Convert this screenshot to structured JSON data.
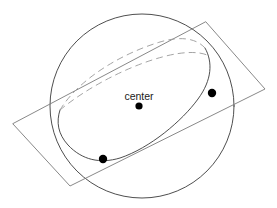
{
  "figure": {
    "background_color": "#ffffff",
    "width": 277,
    "height": 208,
    "stroke_color": "#3a3a3a",
    "dashed_stroke_color": "#8c8c8c",
    "point_color": "#000000",
    "label_color": "#1a1a1a"
  },
  "labels": {
    "center": "center"
  },
  "chart_data": {
    "type": "scatter",
    "title": "",
    "xlabel": "",
    "ylabel": "",
    "xlim": [
      0,
      277
    ],
    "ylim": [
      0,
      208
    ],
    "grid": false,
    "legend": "none",
    "shapes": [
      {
        "name": "sphere-outline-circle",
        "kind": "circle",
        "cx": 142,
        "cy": 106,
        "r": 92,
        "style": "solid",
        "stroke": "#3a3a3a",
        "stroke_width": 0.9,
        "fill": "none"
      },
      {
        "name": "tangent-plane-parallelogram",
        "kind": "polygon",
        "points": [
          [
            206,
            22
          ],
          [
            265,
            89
          ],
          [
            70,
            186
          ],
          [
            13,
            124
          ]
        ],
        "style": "solid",
        "stroke": "#7a7a7a",
        "stroke_width": 0.9,
        "fill": "none"
      },
      {
        "name": "great-circle-front-solid-arc",
        "kind": "path",
        "d": "M 205 48 C 213 62 212 80 198 99 C 182 121 150 148 120 158 C 100 164 82 160 68 145 C 58 134 56 122 60 110",
        "style": "solid",
        "stroke": "#3a3a3a",
        "stroke_width": 0.9,
        "fill": "none"
      },
      {
        "name": "great-circle-back-dashed-arc-upper",
        "kind": "path",
        "d": "M 60 110 C 78 80 120 54 160 42 C 180 36 196 38 205 48",
        "style": "dashed",
        "dash_array": "6 5",
        "stroke": "#9a9a9a",
        "stroke_width": 0.9,
        "fill": "none"
      },
      {
        "name": "great-circle-back-dashed-arc-lower",
        "kind": "path",
        "d": "M 60 110 C 84 90 126 66 166 56 C 186 51 200 52 207 55",
        "style": "dashed",
        "dash_array": "6 5",
        "stroke": "#9a9a9a",
        "stroke_width": 0.9,
        "fill": "none"
      }
    ],
    "points": [
      {
        "name": "center-point",
        "label": "center",
        "x": 139,
        "y": 106,
        "r": 3.6,
        "color": "#000000",
        "label_x": 139,
        "label_y": 100,
        "label_anchor": "middle"
      },
      {
        "name": "right-tangency-point",
        "label": "",
        "x": 212,
        "y": 93,
        "r": 4.2,
        "color": "#000000"
      },
      {
        "name": "lower-left-tangency-point",
        "label": "",
        "x": 103,
        "y": 159,
        "r": 4.2,
        "color": "#000000"
      }
    ]
  }
}
